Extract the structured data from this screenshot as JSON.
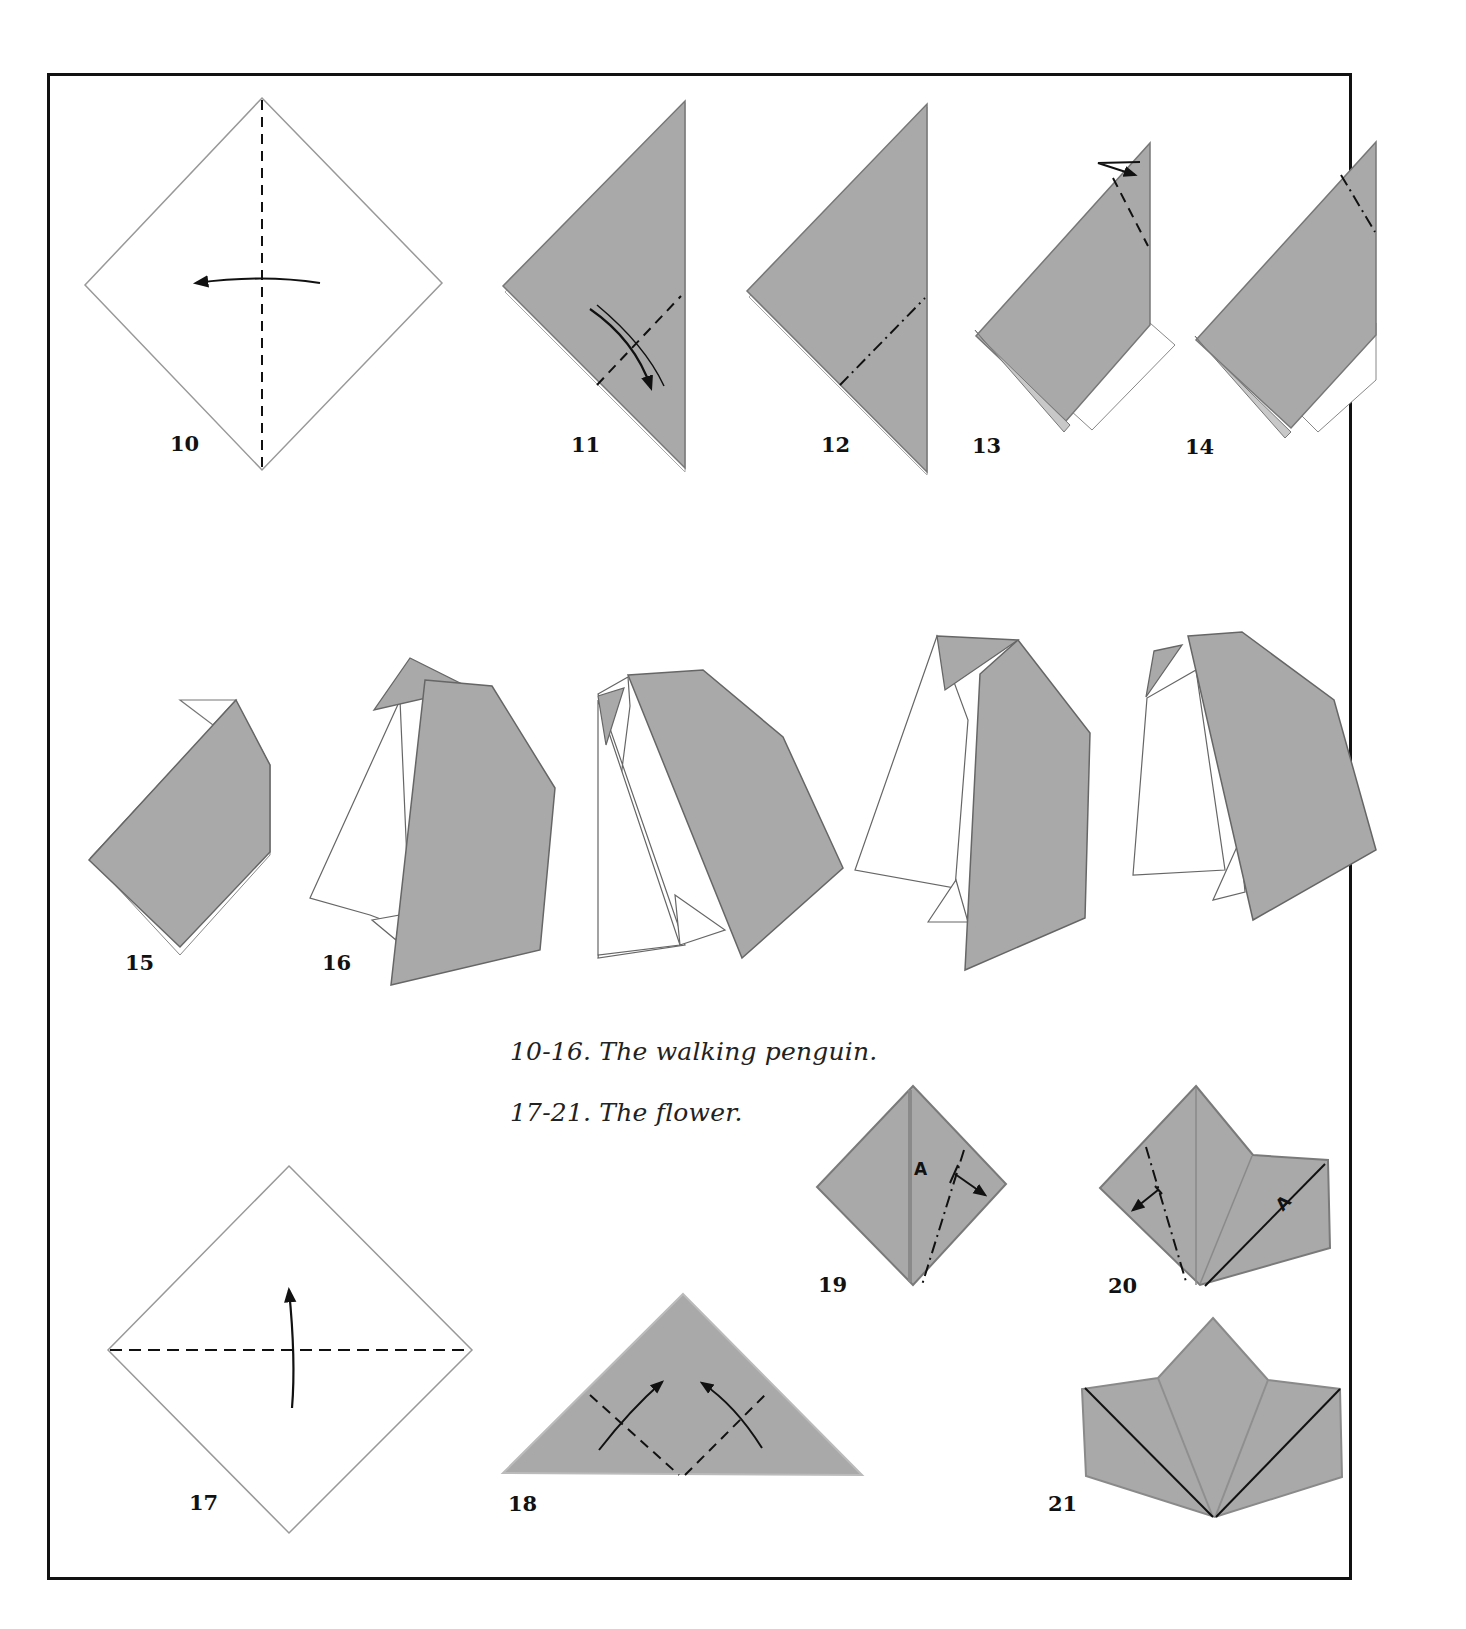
{
  "captions": {
    "penguin": "10-16. The walking penguin.",
    "flower": "17-21. The flower."
  },
  "figures": [
    {
      "number": "10",
      "subject": "penguin",
      "description": "white square diamond, vertical valley fold line, arrow folding right half to left"
    },
    {
      "number": "11",
      "subject": "penguin",
      "description": "gray triangle, dashed fold line near bottom with down-curving arrow"
    },
    {
      "number": "12",
      "subject": "penguin",
      "description": "gray triangle with dash-dot mountain fold line"
    },
    {
      "number": "13",
      "subject": "penguin",
      "description": "folded shape with dashed line at top tip and return arrow"
    },
    {
      "number": "14",
      "subject": "penguin",
      "description": "folded shape with dash-dot line at top tip"
    },
    {
      "number": "15",
      "subject": "penguin",
      "description": "penguin head formed, white beak showing"
    },
    {
      "number": "16",
      "subject": "penguin",
      "description": "four finished walking penguin poses"
    },
    {
      "number": "17",
      "subject": "flower",
      "description": "white diamond with horizontal valley fold and upward arrow"
    },
    {
      "number": "18",
      "subject": "flower",
      "description": "gray triangle with two dashed diagonal folds and arrows"
    },
    {
      "number": "19",
      "subject": "flower",
      "description": "gray diamond with center crease labeled A and dash-dot fold with arrow"
    },
    {
      "number": "20",
      "subject": "flower",
      "description": "left flap folded, right petal opened with line labeled A"
    },
    {
      "number": "21",
      "subject": "flower",
      "description": "finished flower with three petals"
    }
  ],
  "labels": {
    "crease_a_19": "A",
    "crease_a_20": "A"
  },
  "colors": {
    "paper_gray": "#a8a8a8",
    "paper_edge": "#6f6f6f",
    "line": "#111111",
    "frame": "#111111"
  }
}
